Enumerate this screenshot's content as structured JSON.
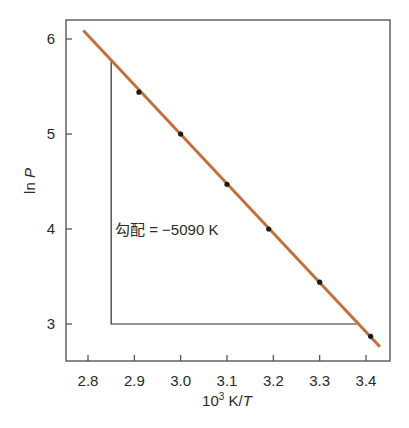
{
  "chart_data": {
    "type": "line",
    "title": "",
    "xlabel": "10³ K/T",
    "xlabel_parts": {
      "base": "10",
      "sup": "3",
      "rest": " K/",
      "italic": "T"
    },
    "ylabel": "ln P",
    "ylabel_parts": {
      "plain": "ln ",
      "italic": "P"
    },
    "xlim": [
      2.75,
      3.44
    ],
    "ylim": [
      2.62,
      6.2
    ],
    "x_ticks": [
      2.8,
      2.9,
      3.0,
      3.1,
      3.2,
      3.3,
      3.4
    ],
    "x_tick_labels": [
      "2.8",
      "2.9",
      "3.0",
      "3.1",
      "3.2",
      "3.3",
      "3.4"
    ],
    "y_ticks": [
      3,
      4,
      5,
      6
    ],
    "y_tick_labels": [
      "3",
      "4",
      "5",
      "6"
    ],
    "grid": false,
    "legend": null,
    "series": [
      {
        "name": "data points",
        "kind": "scatter",
        "color": "#1a1a1a",
        "x": [
          2.91,
          3.0,
          3.1,
          3.19,
          3.3,
          3.41
        ],
        "y": [
          5.44,
          5.0,
          4.47,
          4.0,
          3.44,
          2.87
        ]
      },
      {
        "name": "fit line",
        "kind": "line",
        "color": "#c0703f",
        "x": [
          2.79,
          3.43
        ],
        "y": [
          6.09,
          2.76
        ]
      }
    ],
    "slope_triangle": {
      "x_left": 2.85,
      "x_right": 3.38,
      "y_top": 5.78,
      "y_bottom": 3.0,
      "color": "#2a2a2a"
    },
    "annotations": [
      {
        "text": "勾配 = −5090 K",
        "x": 2.87,
        "y": 4.0
      }
    ]
  }
}
